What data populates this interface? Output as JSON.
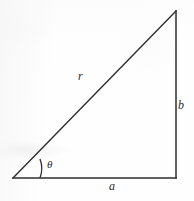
{
  "figure": {
    "kind": "right-triangle-diagram",
    "background_color": "#fefefe",
    "stroke_color": "#2a2a2c",
    "label_color": "#2a2a2c"
  },
  "labels": {
    "hypotenuse": "r",
    "vertical_leg": "b",
    "horizontal_leg": "a",
    "angle": "θ"
  },
  "geometry": {
    "vertex_left": {
      "x": 13,
      "y": 178
    },
    "vertex_right": {
      "x": 176,
      "y": 178
    },
    "vertex_top": {
      "x": 176,
      "y": 11
    },
    "angle_arc_radius": 27,
    "stroke_width": 1.4
  }
}
